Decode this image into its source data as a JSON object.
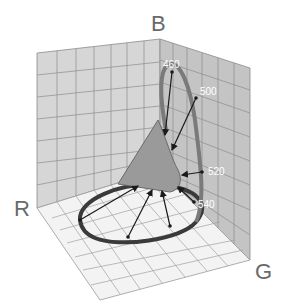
{
  "diagram": {
    "axes": {
      "red_label": "R",
      "green_label": "G",
      "blue_label": "B"
    },
    "wavelength_labels": [
      {
        "id": "wl-460",
        "text": "460"
      },
      {
        "id": "wl-500",
        "text": "500"
      },
      {
        "id": "wl-520",
        "text": "520"
      },
      {
        "id": "wl-540",
        "text": "540"
      },
      {
        "id": "wl-faint-1",
        "text": ""
      },
      {
        "id": "wl-faint-2",
        "text": ""
      }
    ],
    "colors": {
      "left_wall": "#d6d6d6",
      "right_wall": "#c4c4c4",
      "floor": "#f3f3f3",
      "grid_line": "#8c8c8c",
      "locus_ring": "#6e6e6e",
      "triangle_fill": "#9a9a9a",
      "arrow": "#1a1a1a",
      "axis_text": "#6a6a6a"
    }
  }
}
